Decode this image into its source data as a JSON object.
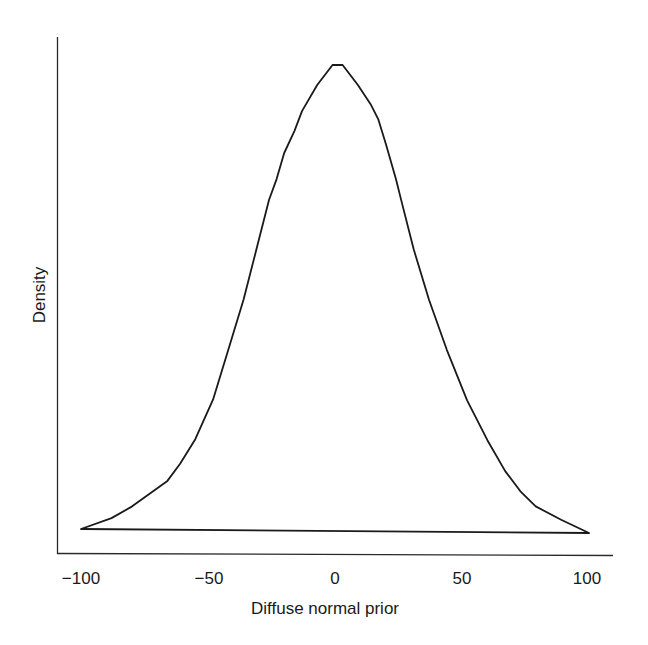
{
  "chart_data": {
    "type": "line",
    "title": "",
    "xlabel": "Diffuse normal prior",
    "ylabel": "Density",
    "xlim": [
      -100,
      100
    ],
    "ylim": [
      0,
      1.05
    ],
    "x_ticks": [
      -100,
      -50,
      0,
      50,
      100
    ],
    "x_tick_labels": [
      "−100",
      "−50",
      "0",
      "50",
      "100"
    ],
    "y_ticks": [],
    "grid": false,
    "legend": null,
    "series": [
      {
        "name": "Density",
        "x": [
          -100,
          -88,
          -80,
          -73,
          -66,
          -61,
          -55,
          -48,
          -42,
          -36,
          -31,
          -26,
          -23,
          -20,
          -16,
          -13,
          -7,
          -1,
          3,
          9,
          14,
          17,
          20,
          24,
          26,
          31,
          37,
          44,
          52,
          60,
          67,
          73,
          79,
          89,
          100
        ],
        "y": [
          0.0,
          0.024,
          0.049,
          0.077,
          0.105,
          0.142,
          0.195,
          0.281,
          0.388,
          0.496,
          0.603,
          0.71,
          0.755,
          0.811,
          0.858,
          0.901,
          0.957,
          1.0,
          1.0,
          0.957,
          0.916,
          0.884,
          0.831,
          0.755,
          0.712,
          0.605,
          0.497,
          0.39,
          0.282,
          0.197,
          0.131,
          0.088,
          0.056,
          0.028,
          0.0
        ]
      }
    ],
    "closed_baseline": true
  },
  "axes": {
    "x_title": "Diffuse normal prior",
    "y_title": "Density"
  },
  "colors": {
    "line": "#1a1a1a",
    "axis": "#2a2a2a",
    "background": "#ffffff"
  }
}
